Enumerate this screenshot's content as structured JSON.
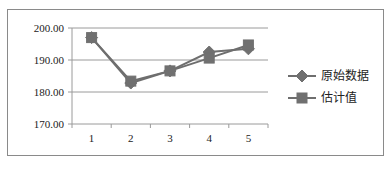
{
  "chart_data": {
    "type": "line",
    "title": "",
    "xlabel": "",
    "ylabel": "",
    "categories": [
      "1",
      "2",
      "3",
      "4",
      "5"
    ],
    "series": [
      {
        "name": "原始数据",
        "marker": "diamond",
        "values": [
          197.0,
          182.8,
          186.6,
          192.5,
          193.5
        ]
      },
      {
        "name": "估计值",
        "marker": "square",
        "values": [
          197.0,
          183.4,
          186.6,
          190.6,
          194.7
        ]
      }
    ],
    "ylim": [
      170,
      200
    ],
    "yticks": [
      "170.00",
      "180.00",
      "190.00",
      "200.00"
    ],
    "grid": true,
    "legend_position": "right"
  },
  "colors": {
    "series_line": "#6e6e6e",
    "marker": "#707070",
    "grid": "#9a9a9a",
    "frame": "#8a8a8a"
  }
}
